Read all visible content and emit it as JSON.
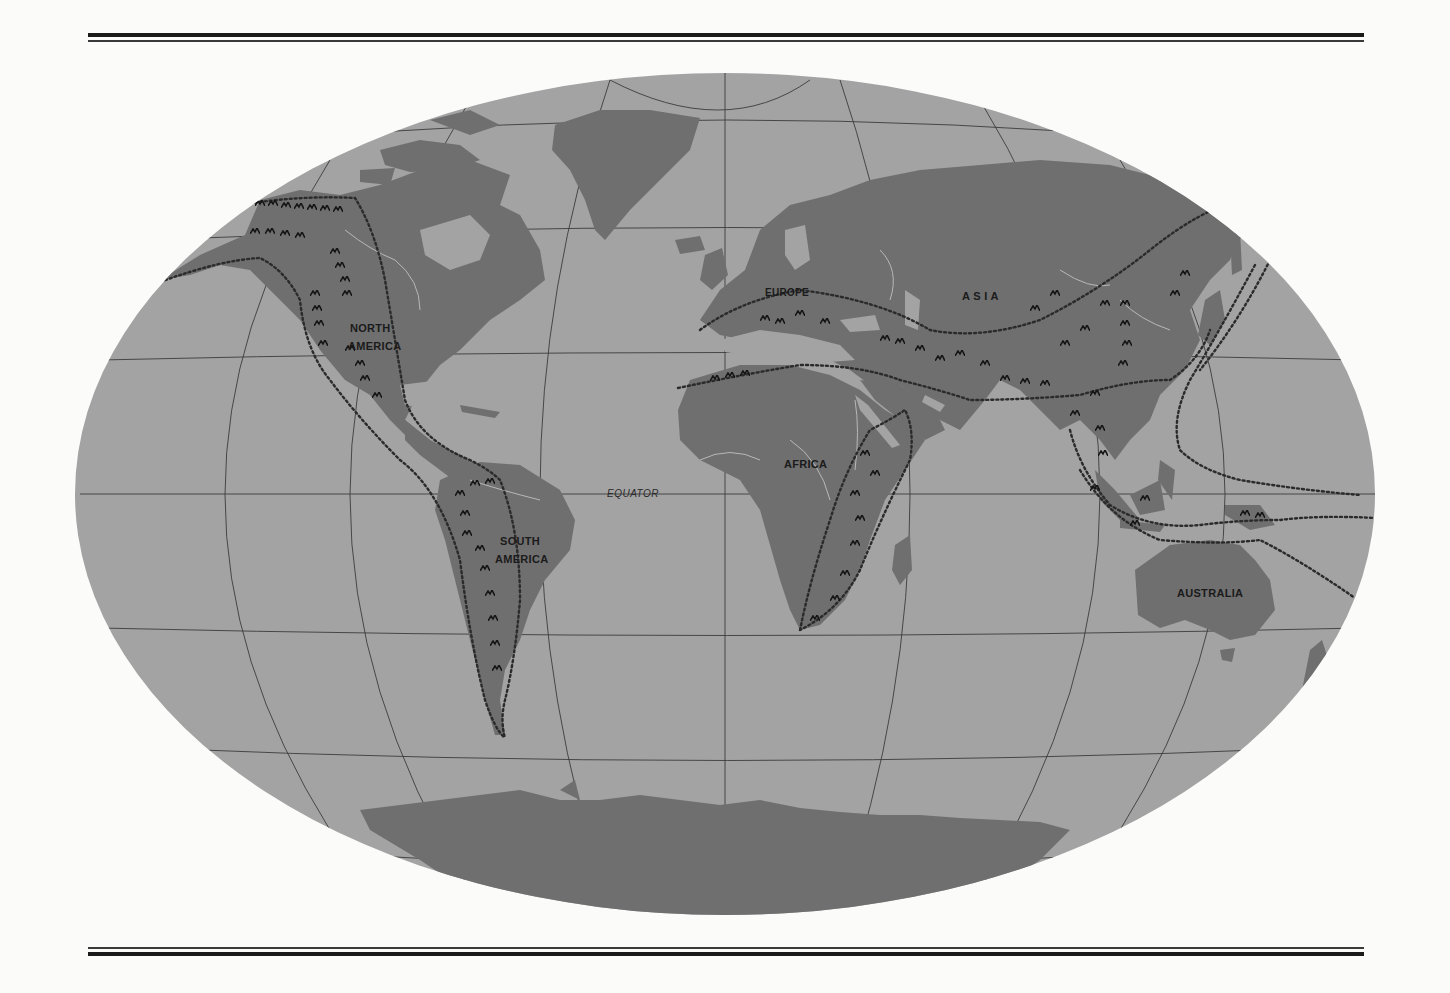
{
  "map": {
    "type": "world map (elliptical projection)",
    "theme": "mountain belts of the world",
    "colors": {
      "page_background": "#fbfbfa",
      "ocean": "#a3a3a3",
      "land": "#6f6f6f",
      "graticule": "#3c3c3c",
      "belt_outline": "#2b2b2b",
      "mountain_symbol": "#161616",
      "river": "#b8b8b8",
      "rule": "#1a1a1a"
    },
    "labels": {
      "north_america_line1": "NORTH",
      "north_america_line2": "AMERICA",
      "south_america_line1": "SOUTH",
      "south_america_line2": "AMERICA",
      "europe": "EUROPE",
      "asia": "A S I A",
      "africa": "AFRICA",
      "australia": "AUSTRALIA",
      "equator": "EQUATOR"
    },
    "legend_features": [
      "dotted line: outline of mountain belt",
      "caret symbols: mountain ranges"
    ]
  }
}
